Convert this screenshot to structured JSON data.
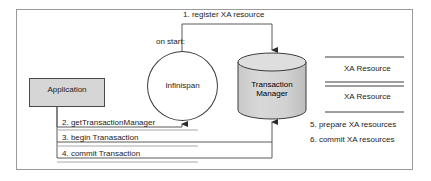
{
  "diagram": {
    "nodes": {
      "application": "Application",
      "infinispan": "Infinispan",
      "transaction_manager_line1": "Transaction",
      "transaction_manager_line2": "Manager"
    },
    "labels": {
      "on_start": "on start:",
      "xa_resource_1": "XA Resource",
      "xa_resource_2": "XA Resource"
    },
    "steps": [
      {
        "number": "1.",
        "text": "1. register XA resource"
      },
      {
        "number": "2.",
        "text": "2. getTransactionManager"
      },
      {
        "number": "3.",
        "text": "3. begin Tranasaction"
      },
      {
        "number": "4.",
        "text": "4. commit Transaction"
      },
      {
        "number": "5.",
        "text": "5. prepare XA resources"
      },
      {
        "number": "6.",
        "text": "6. commit XA resources"
      }
    ],
    "colors": {
      "frame_border": "#9a9a9a",
      "application_fill": "#d6d6d6",
      "cylinder_fill": "#d3d3d3",
      "stroke": "#3c3c3c",
      "text": "#1c1c1c",
      "background": "#ffffff"
    }
  }
}
